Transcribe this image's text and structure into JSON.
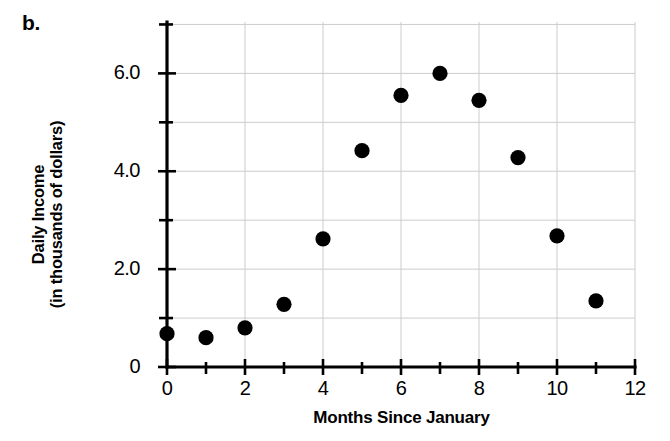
{
  "panel": {
    "label": "b."
  },
  "chart_data": {
    "type": "scatter",
    "title": "",
    "xlabel": "Months Since January",
    "ylabel": "Daily Income\n(in thousands of dollars)",
    "ylabel_line1": "Daily Income",
    "ylabel_line2": "(in thousands of dollars)",
    "xlim": [
      0,
      12
    ],
    "ylim": [
      0,
      7.05
    ],
    "grid": true,
    "grid_color": "#cccccc",
    "legend": "none",
    "marker_color": "#000000",
    "marker_shape": "circle",
    "x_major_ticks": [
      0,
      2,
      4,
      6,
      8,
      10,
      12
    ],
    "x_major_tick_labels": [
      "0",
      "2",
      "4",
      "6",
      "8",
      "10",
      "12"
    ],
    "x_minor_ticks": [
      1,
      3,
      5,
      7,
      9,
      11
    ],
    "y_major_ticks": [
      0,
      2,
      4,
      6
    ],
    "y_major_tick_labels": [
      "0",
      "2.0",
      "4.0",
      "6.0"
    ],
    "y_minor_ticks": [
      1,
      3,
      5,
      7
    ],
    "x": [
      0,
      1,
      2,
      3,
      4,
      5,
      6,
      7,
      8,
      9,
      10,
      11
    ],
    "values": [
      0.68,
      0.6,
      0.8,
      1.28,
      2.62,
      4.42,
      5.55,
      6.0,
      5.45,
      4.28,
      2.68,
      1.35
    ],
    "points": [
      {
        "x": 0,
        "y": 0.68
      },
      {
        "x": 1,
        "y": 0.6
      },
      {
        "x": 2,
        "y": 0.8
      },
      {
        "x": 3,
        "y": 1.28
      },
      {
        "x": 4,
        "y": 2.62
      },
      {
        "x": 5,
        "y": 4.42
      },
      {
        "x": 6,
        "y": 5.55
      },
      {
        "x": 7,
        "y": 6.0
      },
      {
        "x": 8,
        "y": 5.45
      },
      {
        "x": 9,
        "y": 4.28
      },
      {
        "x": 10,
        "y": 2.68
      },
      {
        "x": 11,
        "y": 1.35
      }
    ]
  }
}
